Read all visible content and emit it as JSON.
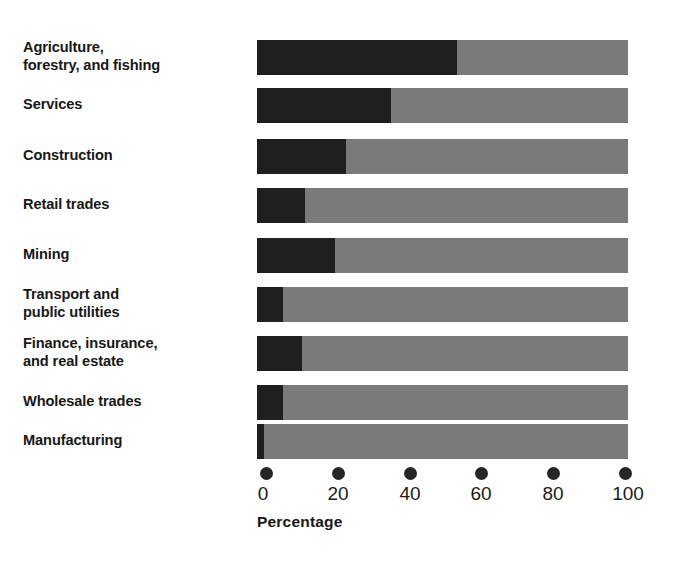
{
  "chart_data": {
    "type": "bar",
    "orientation": "horizontal",
    "stacked": true,
    "stacked_total": 100,
    "title": "",
    "subtitle": "",
    "xlabel": "Percentage",
    "ylabel": "",
    "xlim": [
      0,
      100
    ],
    "xticks": [
      0,
      20,
      40,
      60,
      80,
      100
    ],
    "xtick_labels": [
      "0",
      "20",
      "40",
      "60",
      "80",
      "100"
    ],
    "grid": false,
    "legend": "none",
    "categories": [
      "Agriculture,\nforestry, and fishing",
      "Services",
      "Construction",
      "Retail trades",
      "Mining",
      "Transport and\npublic utilities",
      "Finance, insurance,\nand real estate",
      "Wholesale trades",
      "Manufacturing"
    ],
    "series": [
      {
        "name": "dark-segment",
        "color": "#1f1f1f",
        "values": [
          54,
          36,
          24,
          13,
          21,
          7,
          12,
          7,
          2
        ]
      },
      {
        "name": "light-segment",
        "color": "#7a7a7a",
        "values": [
          46,
          64,
          76,
          87,
          79,
          93,
          88,
          93,
          98
        ]
      }
    ]
  },
  "axis": {
    "title": "Percentage",
    "ticks": [
      "0",
      "20",
      "40",
      "60",
      "80",
      "100"
    ],
    "tick_values": [
      0,
      20,
      40,
      60,
      80,
      100
    ]
  },
  "colors": {
    "dark": "#1f1f1f",
    "light": "#7a7a7a",
    "background": "#ffffff",
    "text": "#171717"
  }
}
